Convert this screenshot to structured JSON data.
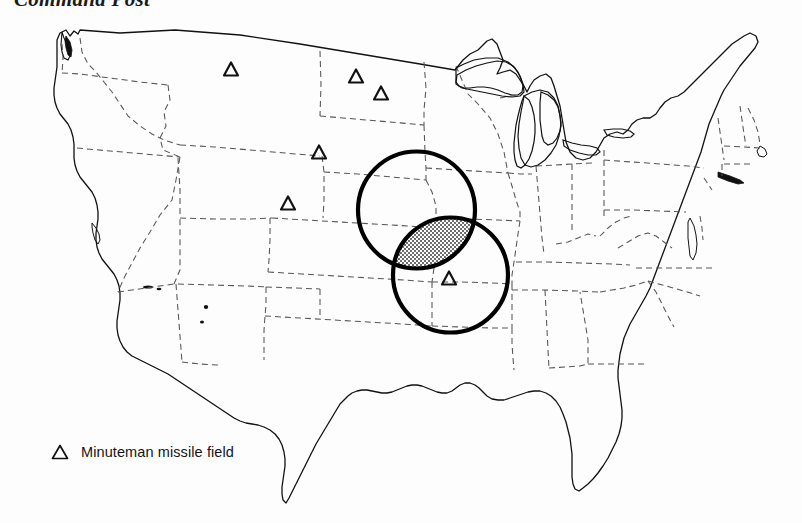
{
  "figure": {
    "title": "Command Post",
    "background_color": "#fdfdfd"
  },
  "legend": {
    "marker_icon": "triangle-marker-icon",
    "label": "Minuteman missile field"
  },
  "map": {
    "region": "Continental United States",
    "outline_color": "#111111",
    "state_border_style": "dashed",
    "state_border_color": "#555555",
    "coastline_color": "#111111"
  },
  "overlays": {
    "circle_color": "#000000",
    "circle_stroke_width": 4.2,
    "intersection_fill": "stipple-hatch",
    "intersection_color": "#4a4a4a",
    "circles": [
      {
        "name": "blast-radius-circle-northwest",
        "cx": 416.5,
        "cy": 210.0,
        "r": 58.5
      },
      {
        "name": "blast-radius-circle-southeast",
        "cx": 450.5,
        "cy": 275.0,
        "r": 57.5
      }
    ]
  },
  "markers": {
    "icon": "triangle-marker-icon",
    "label": "Minuteman missile field",
    "points": [
      {
        "id": "mmf-montana",
        "x": 231,
        "y": 69
      },
      {
        "id": "mmf-north-dakota",
        "x": 356,
        "y": 76
      },
      {
        "id": "mmf-north-dakota-south",
        "x": 381,
        "y": 93
      },
      {
        "id": "mmf-south-dakota",
        "x": 319,
        "y": 152
      },
      {
        "id": "mmf-wyoming",
        "x": 288,
        "y": 203
      },
      {
        "id": "mmf-missouri",
        "x": 449,
        "y": 278
      }
    ]
  },
  "chart_data": {
    "type": "map",
    "title": "Command Post",
    "legend_entries": [
      "Minuteman missile field"
    ],
    "marker_count": 6,
    "circle_count": 2,
    "annotations": [
      "overlapping coverage circles",
      "stippled intersection region"
    ]
  }
}
